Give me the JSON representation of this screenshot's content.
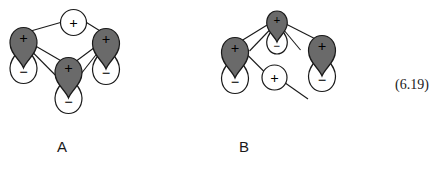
{
  "figure": {
    "equation_number": "(6.19)",
    "background_color": "#ffffff",
    "stroke_color": "#1a1a1a",
    "lobe_positive_fill": "#6a6a6a",
    "lobe_negative_fill": "#ffffff",
    "sign_plus": "+",
    "sign_minus": "−",
    "diagrams": [
      {
        "id": "A",
        "label": "A",
        "caption_position": {
          "x": 62,
          "y": 152
        },
        "description": "Three p-orbitals with a positive s-orbital lobe above, all mutually connected",
        "orbitals": [
          {
            "name": "p-orbital-left",
            "upper_lobe_sign": "+",
            "lower_lobe_sign": "−",
            "upper_lobe_shaded": true
          },
          {
            "name": "p-orbital-center",
            "upper_lobe_sign": "+",
            "lower_lobe_sign": "−",
            "upper_lobe_shaded": true
          },
          {
            "name": "p-orbital-right",
            "upper_lobe_sign": "+",
            "lower_lobe_sign": "−",
            "upper_lobe_shaded": true
          }
        ],
        "s_orbitals": [
          {
            "name": "s-orbital-top",
            "sign": "+"
          }
        ]
      },
      {
        "id": "B",
        "label": "B",
        "caption_position": {
          "x": 244,
          "y": 152
        },
        "description": "Two p-orbitals flanking an inverted p-orbital, with a positive s-orbital below center",
        "orbitals": [
          {
            "name": "p-orbital-left",
            "upper_lobe_sign": "+",
            "lower_lobe_sign": "−",
            "upper_lobe_shaded": true
          },
          {
            "name": "p-orbital-top-center",
            "upper_lobe_sign": "+",
            "lower_lobe_sign": "−",
            "upper_lobe_shaded": true
          },
          {
            "name": "p-orbital-right",
            "upper_lobe_sign": "+",
            "lower_lobe_sign": "−",
            "upper_lobe_shaded": true
          }
        ],
        "s_orbitals": [
          {
            "name": "s-orbital-center",
            "sign": "+"
          }
        ]
      }
    ]
  }
}
